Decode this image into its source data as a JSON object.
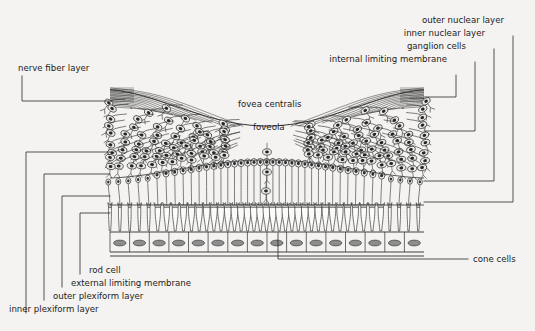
{
  "figure": {
    "background_color": "#f4f3f1",
    "ink_color": "#2e2e2e"
  },
  "labels": {
    "left": [
      {
        "key": "nerve_fiber_layer",
        "text": "nerve fiber layer"
      },
      {
        "key": "rod_cell",
        "text": "rod cell"
      },
      {
        "key": "external_limiting_membrane",
        "text": "external limiting membrane"
      },
      {
        "key": "outer_plexiform_layer",
        "text": "outer plexiform layer"
      },
      {
        "key": "inner_plexiform_layer",
        "text": "inner plexiform layer"
      }
    ],
    "right": [
      {
        "key": "outer_nuclear_layer",
        "text": "outer nuclear layer"
      },
      {
        "key": "inner_nuclear_layer",
        "text": "inner nuclear layer"
      },
      {
        "key": "ganglion_cells",
        "text": "ganglion cells"
      },
      {
        "key": "internal_limiting_membrane",
        "text": "internal limiting membrane"
      },
      {
        "key": "cone_cells",
        "text": "cone cells"
      }
    ],
    "center": [
      {
        "key": "fovea_centralis",
        "text": "fovea centralis"
      },
      {
        "key": "foveola",
        "text": "foveola"
      }
    ]
  }
}
